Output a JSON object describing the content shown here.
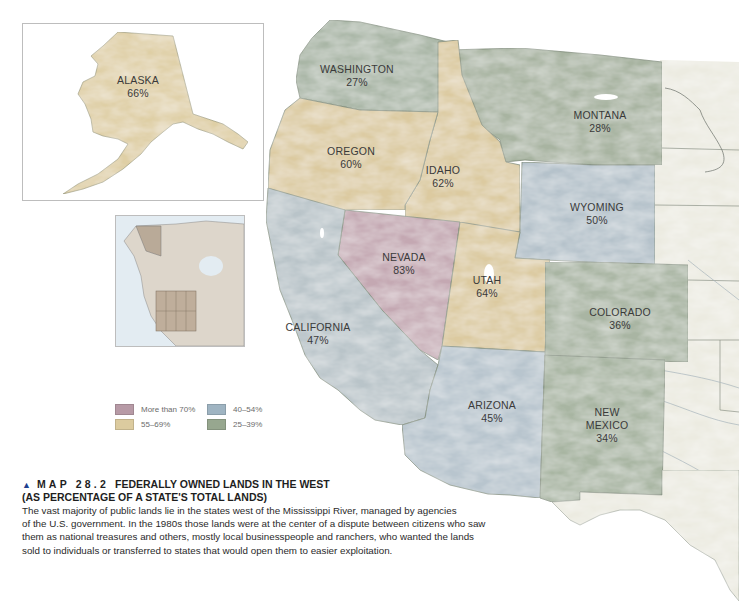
{
  "caption": {
    "marker_icon": "▲",
    "map_number": "MAP 28.2",
    "title_line1": "FEDERALLY OWNED LANDS IN THE WEST",
    "title_line2": "(AS PERCENTAGE OF A STATE'S TOTAL LANDS)",
    "body_lines": [
      "The vast majority of public lands lie in the states west of the Mississippi River, managed by agencies",
      "of the U.S. government. In the 1980s those lands were at the center of a dispute between citizens who saw",
      "them as national treasures and others, mostly local businesspeople and ranchers, who wanted the lands",
      "sold to individuals or transferred to states that would open them to easier exploitation."
    ]
  },
  "legend": {
    "items": [
      {
        "label": "More than 70%",
        "color": "#b79aa6"
      },
      {
        "label": "40–54%",
        "color": "#9fb4c2"
      },
      {
        "label": "55–69%",
        "color": "#dccb9f"
      },
      {
        "label": "25–39%",
        "color": "#97a78f"
      }
    ]
  },
  "colors": {
    "more_than_70": "#c4a8b2",
    "range_55_69": "#dccaa0",
    "range_40_54": "#b6c3cc",
    "range_25_39": "#a9b5a3",
    "background_land": "#ecece2",
    "state_border": "#7d8a78"
  },
  "states": [
    {
      "name": "WASHINGTON",
      "percent": "27%",
      "category": "25–39%"
    },
    {
      "name": "MONTANA",
      "percent": "28%",
      "category": "25–39%"
    },
    {
      "name": "OREGON",
      "percent": "60%",
      "category": "55–69%"
    },
    {
      "name": "IDAHO",
      "percent": "62%",
      "category": "55–69%"
    },
    {
      "name": "WYOMING",
      "percent": "50%",
      "category": "40–54%"
    },
    {
      "name": "NEVADA",
      "percent": "83%",
      "category": "More than 70%"
    },
    {
      "name": "UTAH",
      "percent": "64%",
      "category": "55–69%"
    },
    {
      "name": "CALIFORNIA",
      "percent": "47%",
      "category": "40–54%"
    },
    {
      "name": "COLORADO",
      "percent": "36%",
      "category": "25–39%"
    },
    {
      "name": "ARIZONA",
      "percent": "45%",
      "category": "40–54%"
    },
    {
      "name": "NEW",
      "percent": "34%",
      "category": "25–39%",
      "name_line2": "MEXICO"
    },
    {
      "name": "ALASKA",
      "percent": "66%",
      "category": "55–69%"
    }
  ]
}
